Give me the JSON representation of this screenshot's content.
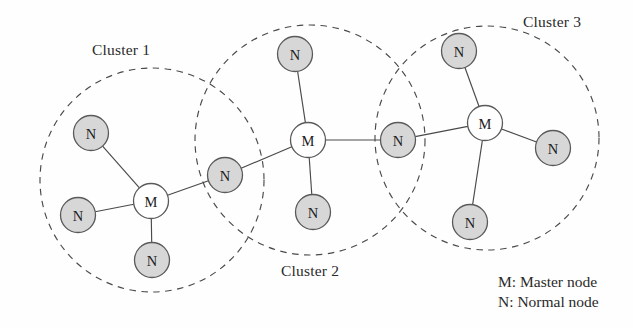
{
  "diagram": {
    "width": 634,
    "height": 329,
    "background_color": "#fefefe",
    "normal_node_fill": "#d7d7d7",
    "master_node_fill": "#ffffff",
    "node_stroke_color": "#5a5a5a",
    "boundary_stroke_color": "#4a4a4a",
    "boundary_style": "dashed",
    "node_radius": 17.5
  },
  "clusters": [
    {
      "id": "cluster-1",
      "label": "Cluster 1",
      "label_x": 92,
      "label_y": 41,
      "boundary": {
        "cx": 152,
        "cy": 180,
        "r": 112
      }
    },
    {
      "id": "cluster-2",
      "label": "Cluster 2",
      "label_x": 281,
      "label_y": 262,
      "boundary": {
        "cx": 310,
        "cy": 140,
        "r": 115
      }
    },
    {
      "id": "cluster-3",
      "label": "Cluster 3",
      "label_x": 523,
      "label_y": 13,
      "boundary": {
        "cx": 487,
        "cy": 138,
        "r": 112
      }
    }
  ],
  "nodes": [
    {
      "id": "n1",
      "label": "N",
      "type": "normal",
      "cx": 91,
      "cy": 133,
      "cluster": "cluster-1"
    },
    {
      "id": "n2",
      "label": "N",
      "type": "normal",
      "cx": 78,
      "cy": 215,
      "cluster": "cluster-1"
    },
    {
      "id": "n3",
      "label": "N",
      "type": "normal",
      "cx": 152,
      "cy": 260,
      "cluster": "cluster-1"
    },
    {
      "id": "m1",
      "label": "M",
      "type": "master",
      "cx": 151,
      "cy": 201,
      "cluster": "cluster-1"
    },
    {
      "id": "g1",
      "label": "N",
      "type": "normal",
      "cx": 225,
      "cy": 175,
      "cluster": "cluster-1,cluster-2"
    },
    {
      "id": "n4",
      "label": "N",
      "type": "normal",
      "cx": 295,
      "cy": 54,
      "cluster": "cluster-2"
    },
    {
      "id": "m2",
      "label": "M",
      "type": "master",
      "cx": 308,
      "cy": 140,
      "cluster": "cluster-2"
    },
    {
      "id": "n5",
      "label": "N",
      "type": "normal",
      "cx": 313,
      "cy": 212,
      "cluster": "cluster-2"
    },
    {
      "id": "g2",
      "label": "N",
      "type": "normal",
      "cx": 398,
      "cy": 140,
      "cluster": "cluster-2,cluster-3"
    },
    {
      "id": "n6",
      "label": "N",
      "type": "normal",
      "cx": 459,
      "cy": 51,
      "cluster": "cluster-3"
    },
    {
      "id": "m3",
      "label": "M",
      "type": "master",
      "cx": 485,
      "cy": 123,
      "cluster": "cluster-3"
    },
    {
      "id": "n7",
      "label": "N",
      "type": "normal",
      "cx": 553,
      "cy": 148,
      "cluster": "cluster-3"
    },
    {
      "id": "n8",
      "label": "N",
      "type": "normal",
      "cx": 470,
      "cy": 222,
      "cluster": "cluster-3"
    }
  ],
  "links": [
    {
      "from": "n1",
      "to": "m1"
    },
    {
      "from": "n2",
      "to": "m1"
    },
    {
      "from": "n3",
      "to": "m1"
    },
    {
      "from": "m1",
      "to": "g1"
    },
    {
      "from": "g1",
      "to": "m2"
    },
    {
      "from": "n4",
      "to": "m2"
    },
    {
      "from": "n5",
      "to": "m2"
    },
    {
      "from": "m2",
      "to": "g2"
    },
    {
      "from": "g2",
      "to": "m3"
    },
    {
      "from": "n6",
      "to": "m3"
    },
    {
      "from": "n7",
      "to": "m3"
    },
    {
      "from": "n8",
      "to": "m3"
    }
  ],
  "legend": {
    "master_line": "M: Master node",
    "normal_line": "N: Normal node"
  }
}
